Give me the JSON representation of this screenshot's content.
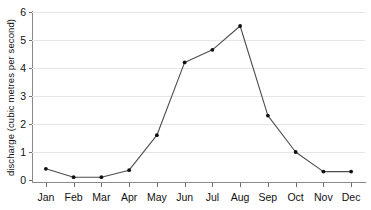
{
  "chart_data": {
    "type": "line",
    "title": "",
    "xlabel": "",
    "ylabel": "discharge (cubic metres per second)",
    "categories": [
      "Jan",
      "Feb",
      "Mar",
      "Apr",
      "May",
      "Jun",
      "Jul",
      "Aug",
      "Sep",
      "Oct",
      "Nov",
      "Dec"
    ],
    "values": [
      0.4,
      0.1,
      0.1,
      0.35,
      1.6,
      4.2,
      4.65,
      5.5,
      2.3,
      1.0,
      0.3,
      0.3
    ],
    "series": [
      {
        "name": "discharge",
        "values": [
          0.4,
          0.1,
          0.1,
          0.35,
          1.6,
          4.2,
          4.65,
          5.5,
          2.3,
          1.0,
          0.3,
          0.3
        ]
      }
    ],
    "ylim": [
      0,
      6
    ],
    "yticks": [
      0,
      1,
      2,
      3,
      4,
      5,
      6
    ],
    "ytick_labels": [
      "0",
      "1",
      "2",
      "3",
      "4",
      "5",
      "6"
    ],
    "grid": true,
    "grid_axis": "y",
    "legend": false,
    "legend_position": "none",
    "marker": "dot",
    "line_color": "#4d4d4d",
    "marker_color": "#111111",
    "grid_color": "#e6e6e6",
    "axis_color": "#8a8a8a",
    "background": "#ffffff"
  }
}
